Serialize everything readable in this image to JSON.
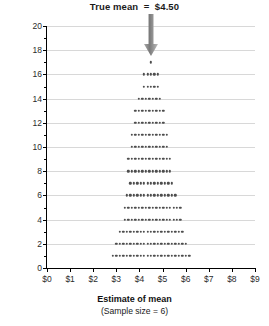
{
  "chart_data": {
    "type": "bar",
    "subtype": "stacked-dot-plot",
    "title": "True mean  =  $4.50",
    "xlabel": "Estimate of mean",
    "xlabel_sub": "(Sample size = 6)",
    "ylabel": "Number of samples (Total = 210)",
    "grid": true,
    "legend": "none",
    "xlim": [
      0,
      9
    ],
    "ylim": [
      0,
      20
    ],
    "xticks": [
      0,
      1,
      2,
      3,
      4,
      5,
      6,
      7,
      8,
      9
    ],
    "xticklabels": [
      "$0",
      "$1",
      "$2",
      "$3",
      "$4",
      "$5",
      "$6",
      "$7",
      "$8",
      "$9"
    ],
    "yticks": [
      0,
      2,
      4,
      6,
      8,
      10,
      12,
      14,
      16,
      18,
      20
    ],
    "yticklabels": [
      "0",
      "2",
      "4",
      "6",
      "8",
      "10",
      "12",
      "14",
      "16",
      "18",
      "20"
    ],
    "dot_spacing": 0.15,
    "bin_width": 0.15,
    "annotations": [
      {
        "name": "true-mean-arrow",
        "x": 4.5,
        "label": "True mean  =  $4.50",
        "color": "#8c8c8c"
      }
    ],
    "dot_color": "#4d4d4d",
    "grid_color": "#d8d8d8",
    "total_samples": 210,
    "rows": [
      {
        "level": 1,
        "count": 23,
        "center": 4.5
      },
      {
        "level": 2,
        "count": 21,
        "center": 4.5
      },
      {
        "level": 3,
        "count": 19,
        "center": 4.5
      },
      {
        "level": 4,
        "count": 17,
        "center": 4.575
      },
      {
        "level": 5,
        "count": 17,
        "center": 4.575
      },
      {
        "level": 6,
        "count": 15,
        "center": 4.5
      },
      {
        "level": 7,
        "count": 13,
        "center": 4.5
      },
      {
        "level": 8,
        "count": 13,
        "center": 4.425
      },
      {
        "level": 9,
        "count": 13,
        "center": 4.425
      },
      {
        "level": 10,
        "count": 11,
        "center": 4.425
      },
      {
        "level": 11,
        "count": 11,
        "center": 4.425
      },
      {
        "level": 12,
        "count": 9,
        "center": 4.425
      },
      {
        "level": 13,
        "count": 9,
        "center": 4.425
      },
      {
        "level": 14,
        "count": 7,
        "center": 4.425
      },
      {
        "level": 15,
        "count": 5,
        "center": 4.5
      },
      {
        "level": 16,
        "count": 5,
        "center": 4.5
      },
      {
        "level": 17,
        "count": 1,
        "center": 4.5
      },
      {
        "level": 18,
        "count": 1,
        "center": 4.5
      }
    ]
  }
}
